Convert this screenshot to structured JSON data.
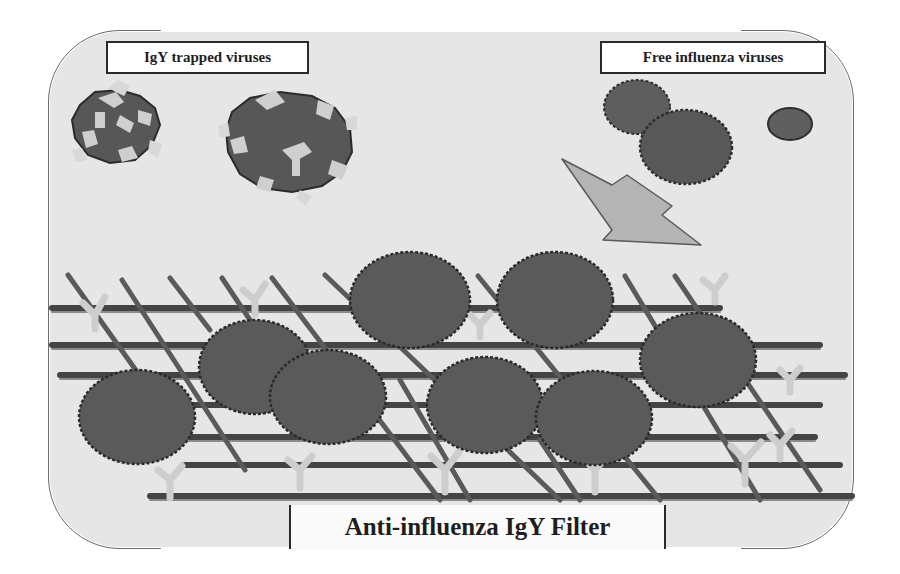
{
  "diagram": {
    "title": "Anti-influenza IgY Filter",
    "labels": {
      "trapped": "IgY trapped viruses",
      "free": "Free influenza viruses",
      "filter": "Anti-influenza IgY Filter"
    },
    "colors": {
      "background": "#e6e6e6",
      "virus": "#5a5a5a",
      "virus_outline": "#2e2e2e",
      "mesh_bar": "#4a4a4a",
      "antibody": "#c8c8c8",
      "arrow": "#b4b4b4"
    },
    "elements": {
      "trapped_viruses_count": 2,
      "free_viruses_count": 3,
      "filter_bound_viruses_count": 8,
      "arrow_direction": "down-right toward filter"
    }
  }
}
